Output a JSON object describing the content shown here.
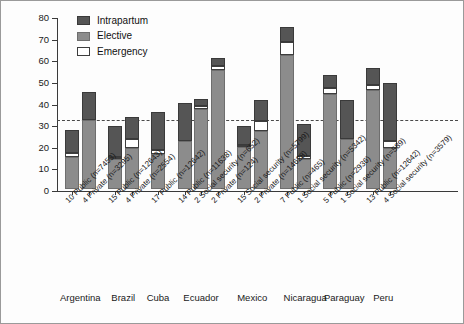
{
  "chart_data": {
    "type": "bar",
    "title": "",
    "subtitle": "",
    "xlabel": "",
    "ylabel": "",
    "ylim": [
      0,
      80
    ],
    "yticks": [
      0,
      10,
      20,
      30,
      40,
      50,
      60,
      70,
      80
    ],
    "ytick_labels": [
      "0",
      "10",
      "20",
      "30",
      "40",
      "50",
      "60",
      "70",
      "80"
    ],
    "grid": false,
    "legend_position": "top-left",
    "stacked": true,
    "annotations": [
      {
        "type": "reference-line",
        "axis": "y",
        "value": 33,
        "style": "dashed"
      }
    ],
    "legend": [
      "Intrapartum",
      "Elective",
      "Emergency"
    ],
    "series": [
      {
        "name": "Elective",
        "color": "#8c8c8c",
        "values": [
          15,
          32,
          14,
          19,
          16,
          22,
          37,
          55,
          19.5,
          27,
          62,
          14,
          44,
          23,
          46,
          19
        ]
      },
      {
        "name": "Emergency",
        "color": "#ffffff",
        "values": [
          1.5,
          0,
          1,
          4,
          2,
          0,
          1.5,
          2,
          1,
          4.5,
          6,
          1.5,
          2.5,
          0,
          2,
          3
        ]
      },
      {
        "name": "Intrapartum",
        "color": "#555555",
        "values": [
          11,
          13,
          14,
          10.5,
          17.5,
          18,
          3,
          3.5,
          8.5,
          9.5,
          7,
          14.5,
          6,
          18,
          8,
          27
        ]
      }
    ],
    "totals": [
      27.5,
      45,
      29,
      33.5,
      35.5,
      40,
      41.5,
      60.5,
      29,
      41,
      75,
      30,
      52.5,
      41,
      56,
      49
    ],
    "categories": [
      "10 Public (n=7453)",
      "4 Private (n=3295)",
      "15 Public (n=12643)",
      "4 Private (n=2554)",
      "17 Public (n=12642)",
      "14 Public (n=11638)",
      "2 Social security (n=652)",
      "2 Private (n=124)",
      "15 Social security (n=5799)",
      "2 Private (n=14628)",
      "7 Public (n=465)",
      "1 Social security (n=5342)",
      "5 Public (n=2936)",
      "1 Social security (n=589)",
      "13 Public (n=12642)",
      "4 Social security (n=3579)"
    ],
    "group_labels": [
      "Argentina",
      "Brazil",
      "Cuba",
      "Ecuador",
      "Mexico",
      "Nicaragua",
      "Paraguay",
      "Peru"
    ],
    "group_sizes": [
      2,
      2,
      1,
      3,
      2,
      2,
      2,
      2
    ]
  }
}
